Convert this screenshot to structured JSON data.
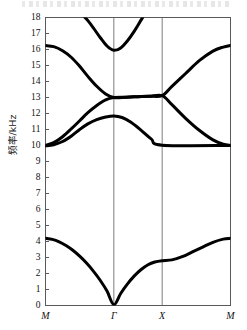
{
  "figure": {
    "kind": "phononic-band-structure-plot",
    "background_color": "#ffffff",
    "curve_color": "#000000",
    "axis_color": "#5a5a5a",
    "gridline_color": "#6e6e6e"
  },
  "axes": {
    "y_axis_title": "频率/kHz",
    "y_ticks": [
      "0",
      "1",
      "2",
      "3",
      "4",
      "5",
      "6",
      "7",
      "8",
      "9",
      "10",
      "11",
      "12",
      "13",
      "14",
      "15",
      "16",
      "17",
      "18"
    ],
    "y_min": 0,
    "y_max": 18,
    "x_ticks": [
      "M",
      "Γ",
      "X",
      "M"
    ],
    "x_tick_positions": [
      0,
      1,
      1.707,
      2.707
    ],
    "x_min": 0,
    "x_max": 2.707
  },
  "chart_data": {
    "type": "line",
    "title": "",
    "xlabel": "",
    "ylabel": "频率/kHz",
    "ylim": [
      0,
      18
    ],
    "xlim": [
      0,
      2.707
    ],
    "grid": "vertical-only",
    "legend": "none",
    "xtick_labels": [
      "M",
      "Γ",
      "X",
      "M"
    ],
    "xtick_values": [
      0,
      1,
      1.707,
      2.707
    ],
    "series": [
      {
        "name": "band-1-acoustic",
        "x": [
          0,
          0.1,
          0.2,
          0.3,
          0.4,
          0.5,
          0.6,
          0.7,
          0.8,
          0.9,
          1.0,
          1.1,
          1.2,
          1.3,
          1.4,
          1.5,
          1.6,
          1.707,
          1.85,
          2.0,
          2.15,
          2.3,
          2.45,
          2.6,
          2.707
        ],
        "y": [
          4.2,
          4.13,
          3.98,
          3.75,
          3.45,
          3.08,
          2.65,
          2.15,
          1.58,
          0.9,
          0.05,
          0.75,
          1.35,
          1.85,
          2.25,
          2.55,
          2.72,
          2.8,
          2.85,
          3.05,
          3.35,
          3.65,
          3.95,
          4.15,
          4.2
        ]
      },
      {
        "name": "band-2",
        "x": [
          0,
          0.12,
          0.25,
          0.38,
          0.5,
          0.62,
          0.75,
          0.88,
          1.0,
          1.12,
          1.25,
          1.4,
          1.55,
          1.707,
          2.707
        ],
        "y": [
          9.98,
          10.05,
          10.25,
          10.6,
          11.0,
          11.35,
          11.62,
          11.78,
          11.85,
          11.75,
          11.45,
          10.95,
          10.4,
          10.02,
          10.0
        ]
      },
      {
        "name": "band-3",
        "x": [
          0,
          0.12,
          0.25,
          0.38,
          0.5,
          0.62,
          0.75,
          0.88,
          1.0,
          1.18,
          1.35,
          1.52,
          1.707,
          1.85,
          2.05,
          2.25,
          2.45,
          2.6,
          2.707
        ],
        "y": [
          10.0,
          10.18,
          10.55,
          11.05,
          11.55,
          12.05,
          12.5,
          12.85,
          13.0,
          13.02,
          13.05,
          13.08,
          13.12,
          12.55,
          11.7,
          10.95,
          10.35,
          10.08,
          10.0
        ]
      },
      {
        "name": "band-4",
        "x": [
          0,
          0.12,
          0.25,
          0.38,
          0.5,
          0.62,
          0.75,
          0.88,
          1.0,
          1.18,
          1.35,
          1.52,
          1.707,
          1.85,
          2.05,
          2.25,
          2.45,
          2.6,
          2.707
        ],
        "y": [
          16.25,
          16.18,
          15.92,
          15.5,
          14.95,
          14.32,
          13.7,
          13.22,
          13.0,
          13.02,
          13.05,
          13.08,
          13.12,
          13.7,
          14.5,
          15.3,
          15.9,
          16.15,
          16.25
        ]
      },
      {
        "name": "band-5-upper",
        "x": [
          0.4,
          0.5,
          0.6,
          0.7,
          0.8,
          0.9,
          1.0,
          1.1,
          1.2,
          1.3,
          1.4,
          1.5
        ],
        "y": [
          18.55,
          18.3,
          17.9,
          17.35,
          16.75,
          16.22,
          15.95,
          16.1,
          16.55,
          17.15,
          17.85,
          18.55
        ]
      }
    ],
    "notes": [
      "Acoustic band starts at 0 kHz at Gamma.",
      "Flat band segment at 10.0 kHz between X and M.",
      "Degenerate band crossing near 13.0 kHz from Gamma to X.",
      "Upper band is clipped by the top of the frame at 18 kHz."
    ]
  }
}
